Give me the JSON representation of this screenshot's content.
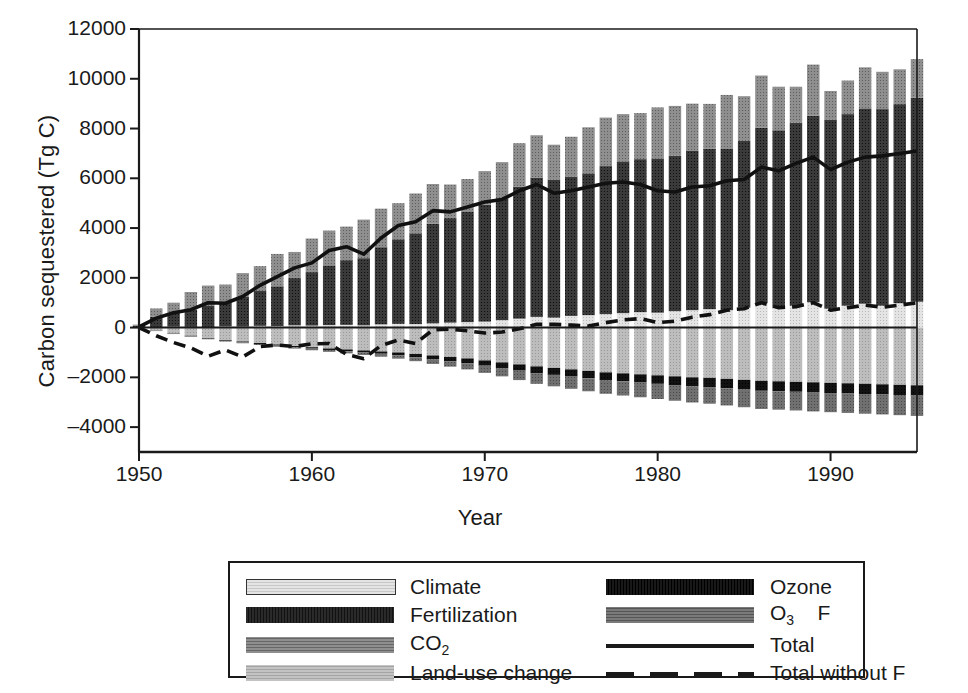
{
  "chart_data": {
    "type": "bar",
    "title": "",
    "xlabel": "Year",
    "ylabel": "Carbon sequestered (Tg C)",
    "xlim": [
      1950,
      1995
    ],
    "ylim": [
      -5000,
      12000
    ],
    "yticks": [
      12000,
      10000,
      8000,
      6000,
      4000,
      2000,
      0,
      -2000,
      -4000
    ],
    "ytick_labels": [
      "12000",
      "10000",
      "8000",
      "6000",
      "4000",
      "2000",
      "0",
      "–2000",
      "–4000"
    ],
    "xticks": [
      1950,
      1960,
      1970,
      1980,
      1990
    ],
    "xtick_labels": [
      "1950",
      "1960",
      "1970",
      "1980",
      "1990"
    ],
    "grid": false,
    "stacked": true,
    "legend_position": "below-outside",
    "x": [
      1950,
      1951,
      1952,
      1953,
      1954,
      1955,
      1956,
      1957,
      1958,
      1959,
      1960,
      1961,
      1962,
      1963,
      1964,
      1965,
      1966,
      1967,
      1968,
      1969,
      1970,
      1971,
      1972,
      1973,
      1974,
      1975,
      1976,
      1977,
      1978,
      1979,
      1980,
      1981,
      1982,
      1983,
      1984,
      1985,
      1986,
      1987,
      1988,
      1989,
      1990,
      1991,
      1992,
      1993,
      1994,
      1995
    ],
    "series": [
      {
        "name": "Climate",
        "color": "#d9d9d9",
        "pattern": "fine-dots-light",
        "stack": "positive",
        "values": [
          0,
          20,
          40,
          30,
          10,
          50,
          40,
          70,
          60,
          90,
          80,
          100,
          110,
          90,
          130,
          150,
          140,
          170,
          200,
          220,
          240,
          300,
          360,
          430,
          400,
          470,
          500,
          540,
          580,
          620,
          600,
          660,
          700,
          740,
          700,
          800,
          980,
          780,
          880,
          1020,
          760,
          880,
          960,
          880,
          980,
          1040
        ]
      },
      {
        "name": "Fertilization",
        "color": "#3b3b3b",
        "pattern": "dense-dark",
        "stack": "positive",
        "values": [
          80,
          420,
          560,
          700,
          860,
          980,
          1200,
          1400,
          1600,
          1900,
          2150,
          2400,
          2600,
          2700,
          3100,
          3400,
          3650,
          4000,
          4200,
          4450,
          4700,
          4900,
          5300,
          5600,
          5550,
          5600,
          5700,
          5950,
          6100,
          6150,
          6200,
          6250,
          6400,
          6450,
          6500,
          6700,
          7050,
          7150,
          7350,
          7500,
          7600,
          7700,
          7850,
          7900,
          8000,
          8200
        ]
      },
      {
        "name": "CO2",
        "color": "#8c8c8c",
        "pattern": "mid-gray",
        "stack": "positive",
        "values": [
          40,
          330,
          400,
          700,
          820,
          700,
          950,
          1000,
          1300,
          1050,
          1350,
          1400,
          1350,
          1550,
          1550,
          1450,
          1600,
          1600,
          1350,
          1300,
          1350,
          1450,
          1750,
          1700,
          1400,
          1600,
          1850,
          1950,
          1900,
          1850,
          2050,
          2000,
          1900,
          1800,
          2150,
          1800,
          2100,
          1750,
          1450,
          2050,
          1150,
          1350,
          1650,
          1500,
          1400,
          1550
        ]
      },
      {
        "name": "Land-use change",
        "color": "#b3b3b3",
        "pattern": "light-gray",
        "stack": "negative",
        "values": [
          0,
          -120,
          -230,
          -330,
          -420,
          -500,
          -560,
          -620,
          -680,
          -740,
          -790,
          -840,
          -880,
          -920,
          -960,
          -1000,
          -1060,
          -1120,
          -1180,
          -1240,
          -1320,
          -1400,
          -1480,
          -1560,
          -1620,
          -1680,
          -1740,
          -1800,
          -1840,
          -1880,
          -1920,
          -1960,
          -2000,
          -2020,
          -2060,
          -2100,
          -2140,
          -2160,
          -2180,
          -2200,
          -2220,
          -2240,
          -2260,
          -2280,
          -2300,
          -2320
        ]
      },
      {
        "name": "Ozone",
        "color": "#111111",
        "pattern": "black",
        "stack": "negative",
        "values": [
          0,
          -10,
          -15,
          -20,
          -25,
          -30,
          -35,
          -40,
          -45,
          -50,
          -55,
          -60,
          -70,
          -80,
          -90,
          -110,
          -130,
          -150,
          -170,
          -190,
          -210,
          -230,
          -250,
          -270,
          -280,
          -290,
          -300,
          -310,
          -320,
          -330,
          -340,
          -350,
          -360,
          -370,
          -380,
          -390,
          -400,
          -400,
          -400,
          -410,
          -410,
          -410,
          -410,
          -410,
          -410,
          -410
        ]
      },
      {
        "name": "O3 x F",
        "color": "#6e6e6e",
        "pattern": "mid-dark-gray",
        "stack": "negative",
        "values": [
          0,
          -10,
          -15,
          -20,
          -25,
          -30,
          -35,
          -40,
          -45,
          -55,
          -65,
          -75,
          -85,
          -100,
          -120,
          -140,
          -160,
          -190,
          -220,
          -250,
          -290,
          -330,
          -380,
          -430,
          -460,
          -490,
          -520,
          -550,
          -570,
          -590,
          -610,
          -630,
          -650,
          -670,
          -690,
          -710,
          -730,
          -740,
          -750,
          -760,
          -770,
          -780,
          -790,
          -800,
          -810,
          -820
        ]
      },
      {
        "name": "Total",
        "type": "line",
        "style": "solid",
        "color": "#111111",
        "values": [
          30,
          380,
          600,
          720,
          1000,
          980,
          1250,
          1700,
          2050,
          2400,
          2600,
          3100,
          3250,
          2950,
          3600,
          4100,
          4250,
          4700,
          4650,
          4850,
          5050,
          5150,
          5500,
          5750,
          5400,
          5500,
          5650,
          5800,
          5850,
          5750,
          5500,
          5450,
          5650,
          5700,
          5900,
          5950,
          6450,
          6300,
          6600,
          6850,
          6350,
          6650,
          6850,
          6900,
          7000,
          7100
        ]
      },
      {
        "name": "Total without F",
        "type": "line",
        "style": "dashed",
        "color": "#111111",
        "values": [
          0,
          -330,
          -600,
          -820,
          -1150,
          -900,
          -1180,
          -760,
          -700,
          -760,
          -650,
          -640,
          -1080,
          -1250,
          -720,
          -500,
          -640,
          -90,
          -60,
          -130,
          -220,
          -180,
          -50,
          130,
          130,
          100,
          60,
          200,
          310,
          360,
          200,
          260,
          420,
          520,
          700,
          760,
          1000,
          800,
          840,
          1000,
          700,
          800,
          900,
          820,
          900,
          1000
        ]
      }
    ]
  },
  "legend": {
    "entries": [
      {
        "label": "Climate",
        "swatch": "climate"
      },
      {
        "label": "Ozone",
        "swatch": "ozone"
      },
      {
        "label": "Fertilization",
        "swatch": "fertilization"
      },
      {
        "label": "O3F",
        "swatch": "o3f"
      },
      {
        "label": "CO2",
        "swatch": "co2"
      },
      {
        "label": "Total",
        "swatch": "total-line"
      },
      {
        "label": "Land-use change",
        "swatch": "landuse"
      },
      {
        "label": "Total without F",
        "swatch": "total-without-f-line"
      }
    ]
  }
}
